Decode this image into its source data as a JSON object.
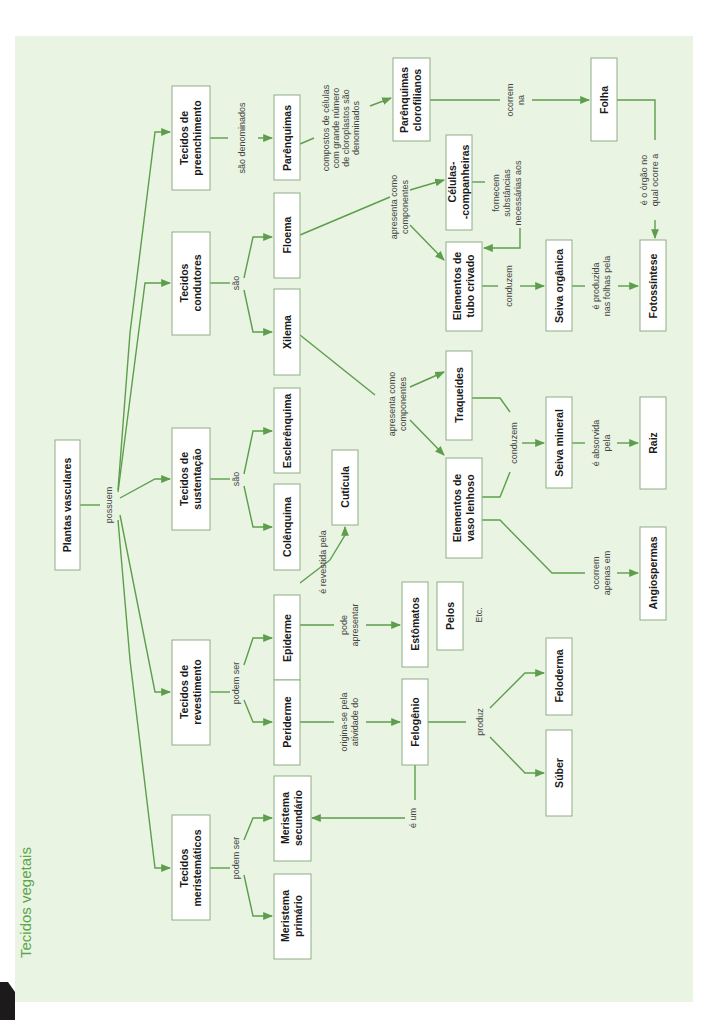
{
  "title": "Tecidos vegetais",
  "colors": {
    "panel": "#e9f4e2",
    "line": "#5c9e4c",
    "title": "#5aa64a",
    "box_border": "#8fae85"
  },
  "nodes": {
    "plantas": [
      "Plantas vasculares"
    ],
    "preenchimento": [
      "Tecidos de",
      "preenchimento"
    ],
    "condutores": [
      "Tecidos",
      "condutores"
    ],
    "sustentacao": [
      "Tecidos de",
      "sustentação"
    ],
    "revestimento": [
      "Tecidos de",
      "revestimento"
    ],
    "meristematicos": [
      "Tecidos",
      "meristemáticos"
    ],
    "parenquimas": [
      "Parênquimas"
    ],
    "floema": [
      "Floema"
    ],
    "xilema": [
      "Xilema"
    ],
    "esclerenquima": [
      "Esclerênquima"
    ],
    "colenquima": [
      "Colênquima"
    ],
    "epiderme": [
      "Epiderme"
    ],
    "periderme": [
      "Periderme"
    ],
    "mer_secundario": [
      "Meristema",
      "secundário"
    ],
    "mer_primario": [
      "Meristema",
      "primário"
    ],
    "cuticula": [
      "Cutícula"
    ],
    "par_clorofilianos": [
      "Parênquimas",
      "clorofilianos"
    ],
    "celulas_comp": [
      "Células-",
      "-companheiras"
    ],
    "tubo_crivado": [
      "Elementos de",
      "tubo crivado"
    ],
    "traqueides": [
      "Traqueídes"
    ],
    "vaso_lenhoso": [
      "Elementos de",
      "vaso lenhoso"
    ],
    "estomatos": [
      "Estômatos"
    ],
    "pelos": [
      "Pelos"
    ],
    "felogenio": [
      "Felogênio"
    ],
    "seiva_organica": [
      "Seiva orgânica"
    ],
    "seiva_mineral": [
      "Seiva mineral"
    ],
    "feloderma": [
      "Feloderma"
    ],
    "suber": [
      "Súber"
    ],
    "folha": [
      "Folha"
    ],
    "fotossintese": [
      "Fotossíntese"
    ],
    "raiz": [
      "Raiz"
    ],
    "angiospermas": [
      "Angiospermas"
    ]
  },
  "labels": {
    "possuem": [
      "possuem"
    ],
    "sao_denominados": [
      "são denominados"
    ],
    "sao_condutores": [
      "são"
    ],
    "sao_sustentacao": [
      "são"
    ],
    "podem_ser_rev": [
      "podem ser"
    ],
    "podem_ser_mer": [
      "podem ser"
    ],
    "compostos": [
      "compostos de células",
      "com grande número",
      "de cloroplastos são",
      "denominados"
    ],
    "ocorrem_na": [
      "ocorrem",
      "na"
    ],
    "e_o_orgao": [
      "é o órgão no",
      "qual ocorre a"
    ],
    "apresenta_floema": [
      "apresenta como",
      "componentes"
    ],
    "fornecem": [
      "fornecem",
      "substâncias",
      "necessárias aos"
    ],
    "conduzem_org": [
      "conduzem"
    ],
    "e_produzida": [
      "é produzida",
      "nas folhas pela"
    ],
    "apresenta_xilema": [
      "apresenta como",
      "componentes"
    ],
    "conduzem_min": [
      "conduzem"
    ],
    "e_absorvida": [
      "é absorvida",
      "pela"
    ],
    "ocorrem_apenas": [
      "ocorrem",
      "apenas em"
    ],
    "e_revestida": [
      "é revestida pela"
    ],
    "pode_apresentar": [
      "pode",
      "apresentar"
    ],
    "etc": [
      "Etc."
    ],
    "origina_se": [
      "origina-se pela",
      "atividade do"
    ],
    "produz": [
      "produz"
    ],
    "e_um": [
      "é um"
    ]
  }
}
